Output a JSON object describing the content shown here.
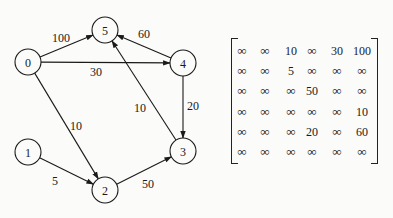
{
  "graph": {
    "nodes": [
      {
        "id": "0",
        "x": 28,
        "y": 62
      },
      {
        "id": "1",
        "x": 28,
        "y": 152
      },
      {
        "id": "2",
        "x": 105,
        "y": 190
      },
      {
        "id": "3",
        "x": 183,
        "y": 151
      },
      {
        "id": "4",
        "x": 183,
        "y": 63
      },
      {
        "id": "5",
        "x": 105,
        "y": 30
      }
    ],
    "edges": [
      {
        "from": "0",
        "to": "5",
        "weight": "100",
        "lx": 52,
        "ly": 42
      },
      {
        "from": "4",
        "to": "5",
        "weight": "60",
        "lx": 138,
        "ly": 38
      },
      {
        "from": "0",
        "to": "4",
        "weight": "30",
        "lx": 90,
        "ly": 76
      },
      {
        "from": "0",
        "to": "2",
        "weight": "10",
        "lx": 70,
        "ly": 130
      },
      {
        "from": "3",
        "to": "5",
        "weight": "10",
        "lx": 134,
        "ly": 112
      },
      {
        "from": "4",
        "to": "3",
        "weight": "20",
        "lx": 187,
        "ly": 110
      },
      {
        "from": "1",
        "to": "2",
        "weight": "5",
        "lx": 52,
        "ly": 185
      },
      {
        "from": "2",
        "to": "3",
        "weight": "50",
        "lx": 142,
        "ly": 188
      }
    ]
  },
  "matrix": {
    "rows": [
      [
        "∞",
        "∞",
        "10",
        "∞",
        "30",
        "100"
      ],
      [
        "∞",
        "∞",
        "5",
        "∞",
        "∞",
        "∞"
      ],
      [
        "∞",
        "∞",
        "∞",
        "50",
        "∞",
        "∞"
      ],
      [
        "∞",
        "∞",
        "∞",
        "∞",
        "∞",
        "10"
      ],
      [
        "∞",
        "∞",
        "∞",
        "20",
        "∞",
        "60"
      ],
      [
        "∞",
        "∞",
        "∞",
        "∞",
        "∞",
        "∞"
      ]
    ]
  }
}
